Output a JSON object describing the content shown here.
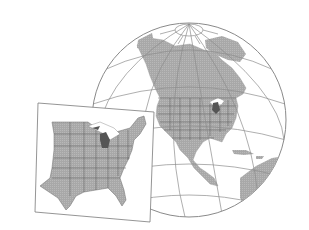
{
  "figure": {
    "description": "Orthographic globe of the Western Hemisphere with graticule, and an overlaid inset map of the eastern United States with Michigan highlighted",
    "colors": {
      "background": "#ffffff",
      "land": "#a9a9a9",
      "water": "#ffffff",
      "graticule": "#8c8c8c",
      "state_borders": "#5a5a5a",
      "highlight_state": "#555555",
      "inset_frame": "#7a7a7a"
    },
    "globe": {
      "center": [
        189,
        120
      ],
      "radius": 97,
      "highlight": "Michigan"
    },
    "inset": {
      "region": "Eastern United States",
      "highlight": "Michigan"
    }
  }
}
